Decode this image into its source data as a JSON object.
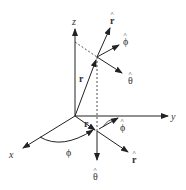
{
  "diagram": {
    "axes": {
      "x_label": "x",
      "y_label": "y",
      "z_label": "z"
    },
    "point_vectors": {
      "r_hat": "r",
      "phi_hat": "ϕ",
      "theta_hat": "θ"
    },
    "position_vector_label": "r",
    "projection_vector_label": "r",
    "angle_label": "ϕ",
    "projected_vectors": {
      "r_hat": "r",
      "phi_hat": "ϕ",
      "theta_hat": "θ"
    },
    "hat_glyph": "^",
    "colors": {
      "line": "#222222",
      "text": "#333333",
      "background": "#ffffff"
    }
  }
}
